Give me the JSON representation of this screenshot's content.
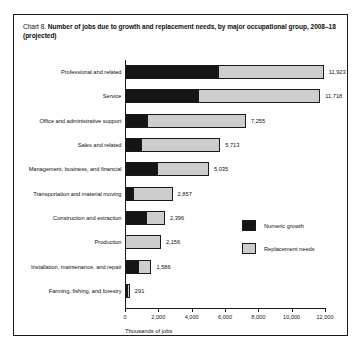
{
  "figure": {
    "chart_number": "Chart 8.",
    "title": "Number of jobs due to growth and replacement needs, by major occupational group, 2008–18 (projected)"
  },
  "legend": {
    "growth_label": "Numeric growth",
    "replacement_label": "Replacement needs"
  },
  "colors": {
    "growth": "#151515",
    "replacement": "#cdcdcd",
    "frame": "#1a1a1a",
    "background": "#fefefe"
  },
  "chart_data": {
    "type": "bar",
    "orientation": "horizontal",
    "stacked": true,
    "title": "Chart 8. Number of jobs due to growth and replacement needs, by major occupational group, 2008–18 (projected)",
    "xlabel": "Thousands of jobs",
    "ylabel": "",
    "xlim": [
      0,
      12000
    ],
    "xticks": [
      0,
      2000,
      4000,
      6000,
      8000,
      10000,
      12000
    ],
    "xtick_labels": [
      "0",
      "2,000",
      "4,000",
      "6,000",
      "8,000",
      "10,000",
      "12,000"
    ],
    "grid": false,
    "legend_position": "center-right",
    "categories": [
      "Professional and related",
      "Service",
      "Office and administrative support",
      "Sales and related",
      "Management, business, and financial",
      "Transportation and material moving",
      "Construction and extraction",
      "Production",
      "Installation, maintenance, and repair",
      "Farming, fishing, and forestry"
    ],
    "series": [
      {
        "name": "Numeric growth",
        "values": [
          5580,
          4380,
          1300,
          900,
          1900,
          450,
          1250,
          0,
          800,
          100
        ]
      },
      {
        "name": "Replacement needs",
        "values": [
          6343,
          7338,
          5955,
          4813,
          3135,
          2407,
          1146,
          2156,
          786,
          191
        ]
      }
    ],
    "totals": [
      11923,
      11718,
      7255,
      5713,
      5035,
      2857,
      2396,
      2156,
      1586,
      291
    ],
    "total_labels": [
      "11,923",
      "11,718",
      "7,255",
      "5,713",
      "5,035",
      "2,857",
      "2,396",
      "2,156",
      "1,586",
      "291"
    ]
  }
}
